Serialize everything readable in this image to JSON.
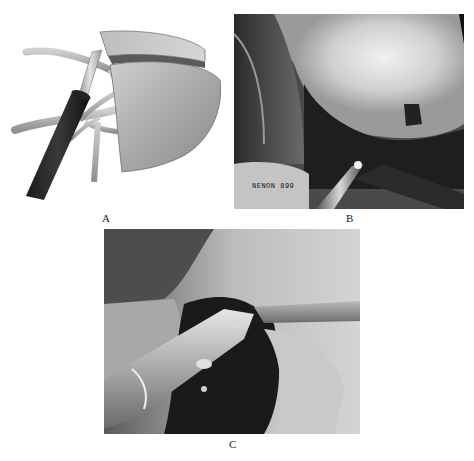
{
  "figure": {
    "panels": [
      {
        "id": "A",
        "label": "A",
        "description": "3D illustration of instrument dividing tissue with branching vessels"
      },
      {
        "id": "B",
        "label": "B",
        "description": "Endoscopic surgical photo",
        "overlay_text": "NENON 899"
      },
      {
        "id": "C",
        "label": "C",
        "description": "Endoscopic surgical photo with instruments"
      }
    ]
  }
}
